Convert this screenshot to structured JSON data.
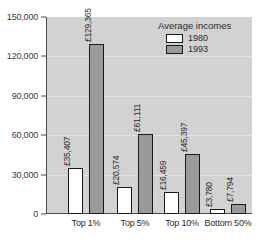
{
  "chart_data": {
    "type": "bar",
    "title": "",
    "xlabel": "",
    "ylabel": "",
    "ylim": [
      0,
      150000
    ],
    "grid": true,
    "legend_position": "top-right",
    "legend_title": "Average incomes",
    "categories": [
      "Top 1%",
      "Top 5%",
      "Top 10%",
      "Bottom 50%"
    ],
    "yticks": [
      "0",
      "30,000",
      "60,000",
      "90,000",
      "120,000",
      "150,000"
    ],
    "ytick_values": [
      0,
      30000,
      60000,
      90000,
      120000,
      150000
    ],
    "series": [
      {
        "name": "1980",
        "color": "#ffffff",
        "values": [
          35407,
          20574,
          16459,
          3780
        ],
        "labels": [
          "£35,407",
          "£20,574",
          "£16,459",
          "£3,780"
        ]
      },
      {
        "name": "1993",
        "color": "#9a9a9a",
        "values": [
          129365,
          61111,
          45397,
          7794
        ],
        "labels": [
          "£129,365",
          "£61,111",
          "£45,397",
          "£7,794"
        ]
      }
    ]
  },
  "colors": {
    "plot_background": "#d2d2d2",
    "axis": "#4a4a4a",
    "bar_1980": "#ffffff",
    "bar_1993": "#9a9a9a",
    "bar_border": "#1a1a1a",
    "gridline": "#e2e2e2",
    "text": "#2b2b2b"
  }
}
